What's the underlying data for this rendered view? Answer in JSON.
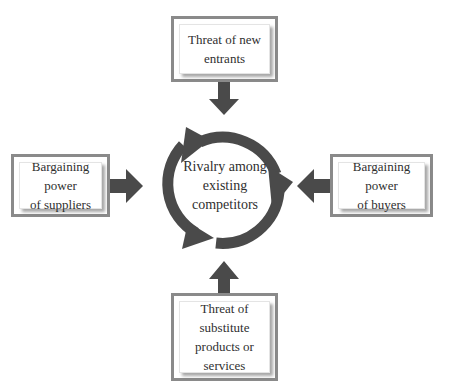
{
  "diagram": {
    "center": {
      "label": "Rivalry among existing competitors",
      "lines": [
        "Rivalry among",
        "existing",
        "competitors"
      ]
    },
    "forces": {
      "top": {
        "lines": [
          "Threat of new",
          "entrants"
        ]
      },
      "left": {
        "lines": [
          "Bargaining power",
          "of suppliers"
        ]
      },
      "right": {
        "lines": [
          "Bargaining power",
          "of buyers"
        ]
      },
      "bottom": {
        "lines": [
          "Threat of",
          "substitute",
          "products or",
          "services"
        ]
      }
    },
    "colors": {
      "arrow": "#4a4a4a",
      "box_border": "#8a8a8a",
      "text": "#2f2f2f",
      "background": "#ffffff"
    }
  }
}
